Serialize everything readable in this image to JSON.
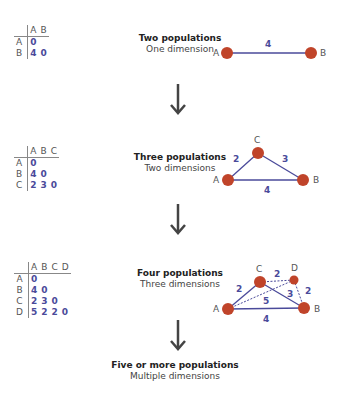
{
  "colors": {
    "node": "#c0442a",
    "edge": "#4a4a9a",
    "label": "#4a4a9a",
    "arrow": "#444444"
  },
  "panels": [
    {
      "title": "Two populations",
      "subtitle": "One dimension",
      "matrix": {
        "cols": [
          "A",
          "B"
        ],
        "rows": [
          {
            "h": "A",
            "v": [
              "0"
            ]
          },
          {
            "h": "B",
            "v": [
              "4",
              "0"
            ]
          }
        ]
      }
    },
    {
      "title": "Three populations",
      "subtitle": "Two dimensions",
      "matrix": {
        "cols": [
          "A",
          "B",
          "C"
        ],
        "rows": [
          {
            "h": "A",
            "v": [
              "0"
            ]
          },
          {
            "h": "B",
            "v": [
              "4",
              "0"
            ]
          },
          {
            "h": "C",
            "v": [
              "2",
              "3",
              "0"
            ]
          }
        ]
      }
    },
    {
      "title": "Four populations",
      "subtitle": "Three dimensions",
      "matrix": {
        "cols": [
          "A",
          "B",
          "C",
          "D"
        ],
        "rows": [
          {
            "h": "A",
            "v": [
              "0"
            ]
          },
          {
            "h": "B",
            "v": [
              "4",
              "0"
            ]
          },
          {
            "h": "C",
            "v": [
              "2",
              "3",
              "0"
            ]
          },
          {
            "h": "D",
            "v": [
              "5",
              "2",
              "2",
              "0"
            ]
          }
        ]
      }
    },
    {
      "title": "Five or more populations",
      "subtitle": "Multiple dimensions"
    }
  ],
  "graphs": {
    "g1": {
      "nodes": [
        "A",
        "B"
      ],
      "edges": [
        {
          "from": "A",
          "to": "B",
          "w": "4"
        }
      ]
    },
    "g2": {
      "nodes": [
        "A",
        "B",
        "C"
      ],
      "edges": [
        {
          "from": "A",
          "to": "C",
          "w": "2"
        },
        {
          "from": "C",
          "to": "B",
          "w": "3"
        },
        {
          "from": "A",
          "to": "B",
          "w": "4"
        }
      ]
    },
    "g3": {
      "nodes": [
        "A",
        "B",
        "C",
        "D"
      ],
      "edges": [
        {
          "from": "A",
          "to": "C",
          "w": "2"
        },
        {
          "from": "C",
          "to": "D",
          "w": "2"
        },
        {
          "from": "C",
          "to": "B",
          "w": "3"
        },
        {
          "from": "D",
          "to": "B",
          "w": "2"
        },
        {
          "from": "A",
          "to": "D",
          "w": "5"
        },
        {
          "from": "A",
          "to": "B",
          "w": "4"
        }
      ]
    }
  }
}
